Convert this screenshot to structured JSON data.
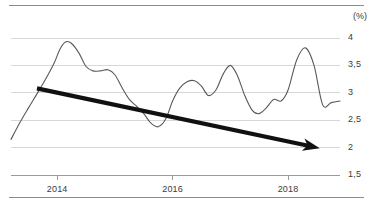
{
  "chart_data": {
    "type": "line",
    "title": "",
    "subtitle": "",
    "xlabel": "",
    "ylabel": "",
    "unit_label": "(%)",
    "grid": true,
    "legend": null,
    "ylim": [
      1.5,
      4.0
    ],
    "yticks": [
      "4",
      "3,5",
      "3",
      "2,5",
      "2",
      "1,5"
    ],
    "ytick_values": [
      4,
      3.5,
      3,
      2.5,
      2,
      1.5
    ],
    "xlim": [
      2013.2,
      2018.9
    ],
    "xticks": [
      "2014",
      "2016",
      "2018"
    ],
    "xtick_values": [
      2014,
      2016,
      2018
    ],
    "series": [
      {
        "name": "rate",
        "color": "#595959",
        "x": [
          2013.2,
          2013.35,
          2013.5,
          2013.65,
          2013.8,
          2013.95,
          2014.05,
          2014.15,
          2014.25,
          2014.38,
          2014.5,
          2014.62,
          2014.75,
          2014.88,
          2015.0,
          2015.12,
          2015.25,
          2015.38,
          2015.5,
          2015.62,
          2015.75,
          2015.88,
          2016.0,
          2016.12,
          2016.25,
          2016.38,
          2016.5,
          2016.62,
          2016.75,
          2016.88,
          2017.0,
          2017.12,
          2017.25,
          2017.38,
          2017.5,
          2017.62,
          2017.75,
          2017.88,
          2018.0,
          2018.15,
          2018.3,
          2018.45,
          2018.6,
          2018.75,
          2018.9
        ],
        "y": [
          2.15,
          2.45,
          2.72,
          2.98,
          3.25,
          3.55,
          3.8,
          3.93,
          3.9,
          3.72,
          3.48,
          3.4,
          3.4,
          3.42,
          3.33,
          3.1,
          2.88,
          2.75,
          2.62,
          2.45,
          2.38,
          2.52,
          2.85,
          3.08,
          3.2,
          3.22,
          3.12,
          2.95,
          3.05,
          3.35,
          3.5,
          3.32,
          2.95,
          2.68,
          2.62,
          2.72,
          2.88,
          2.85,
          3.05,
          3.6,
          3.82,
          3.5,
          2.78,
          2.82,
          2.85
        ]
      }
    ],
    "annotations": [
      {
        "type": "arrow",
        "name": "downward-trend-arrow",
        "color": "#111111",
        "start": {
          "x": 2013.65,
          "y": 3.08
        },
        "end": {
          "x": 2018.55,
          "y": 1.99
        },
        "description": "bold black arrow indicating declining trend"
      }
    ]
  },
  "frame": {
    "top_rule": "",
    "bottom_rule": ""
  }
}
